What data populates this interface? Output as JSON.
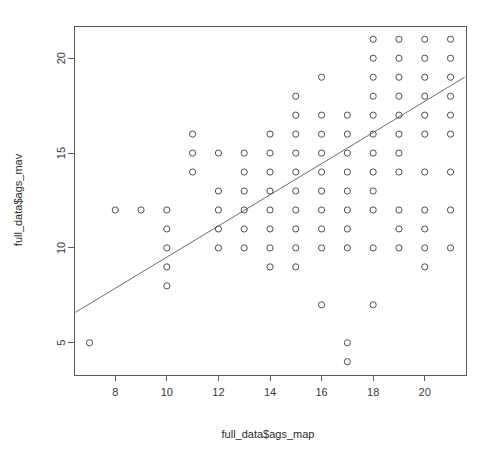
{
  "chart_data": {
    "type": "scatter",
    "title": "",
    "xlabel": "full_data$ags_map",
    "ylabel": "full_data$ags_mav",
    "xlim": [
      6.4,
      21.6
    ],
    "ylim": [
      3.3,
      21.7
    ],
    "xticks": [
      8,
      10,
      12,
      14,
      16,
      18,
      20
    ],
    "yticks": [
      5,
      10,
      15,
      20
    ],
    "xtick_labels": [
      "8",
      "10",
      "12",
      "14",
      "16",
      "18",
      "20"
    ],
    "ytick_labels": [
      "5",
      "10",
      "15",
      "20"
    ],
    "grid": false,
    "legend": "none",
    "marker": "open-circle",
    "marker_color": "#4f4f4f",
    "points": [
      [
        7,
        5
      ],
      [
        8,
        12
      ],
      [
        9,
        12
      ],
      [
        10,
        12
      ],
      [
        10,
        11
      ],
      [
        10,
        10
      ],
      [
        10,
        9
      ],
      [
        10,
        8
      ],
      [
        11,
        16
      ],
      [
        11,
        15
      ],
      [
        11,
        14
      ],
      [
        12,
        15
      ],
      [
        12,
        13
      ],
      [
        12,
        12
      ],
      [
        12,
        11
      ],
      [
        12,
        10
      ],
      [
        13,
        15
      ],
      [
        13,
        14
      ],
      [
        13,
        13
      ],
      [
        13,
        12
      ],
      [
        13,
        11
      ],
      [
        13,
        10
      ],
      [
        14,
        16
      ],
      [
        14,
        15
      ],
      [
        14,
        14
      ],
      [
        14,
        13
      ],
      [
        14,
        12
      ],
      [
        14,
        11
      ],
      [
        14,
        10
      ],
      [
        14,
        9
      ],
      [
        15,
        18
      ],
      [
        15,
        17
      ],
      [
        15,
        16
      ],
      [
        15,
        15
      ],
      [
        15,
        14
      ],
      [
        15,
        13
      ],
      [
        15,
        12
      ],
      [
        15,
        11
      ],
      [
        15,
        10
      ],
      [
        15,
        9
      ],
      [
        16,
        19
      ],
      [
        16,
        17
      ],
      [
        16,
        16
      ],
      [
        16,
        15
      ],
      [
        16,
        14
      ],
      [
        16,
        13
      ],
      [
        16,
        12
      ],
      [
        16,
        11
      ],
      [
        16,
        10
      ],
      [
        16,
        7
      ],
      [
        17,
        17
      ],
      [
        17,
        16
      ],
      [
        17,
        15
      ],
      [
        17,
        14
      ],
      [
        17,
        13
      ],
      [
        17,
        12
      ],
      [
        17,
        11
      ],
      [
        17,
        10
      ],
      [
        17,
        5
      ],
      [
        17,
        4
      ],
      [
        18,
        21
      ],
      [
        18,
        20
      ],
      [
        18,
        19
      ],
      [
        18,
        18
      ],
      [
        18,
        17
      ],
      [
        18,
        16
      ],
      [
        18,
        15
      ],
      [
        18,
        14
      ],
      [
        18,
        13
      ],
      [
        18,
        12
      ],
      [
        18,
        10
      ],
      [
        18,
        7
      ],
      [
        19,
        21
      ],
      [
        19,
        20
      ],
      [
        19,
        19
      ],
      [
        19,
        18
      ],
      [
        19,
        17
      ],
      [
        19,
        16
      ],
      [
        19,
        15
      ],
      [
        19,
        14
      ],
      [
        19,
        12
      ],
      [
        19,
        11
      ],
      [
        19,
        10
      ],
      [
        20,
        21
      ],
      [
        20,
        20
      ],
      [
        20,
        19
      ],
      [
        20,
        18
      ],
      [
        20,
        17
      ],
      [
        20,
        16
      ],
      [
        20,
        14
      ],
      [
        20,
        12
      ],
      [
        20,
        11
      ],
      [
        20,
        10
      ],
      [
        20,
        9
      ],
      [
        21,
        21
      ],
      [
        21,
        20
      ],
      [
        21,
        19
      ],
      [
        21,
        18
      ],
      [
        21,
        17
      ],
      [
        21,
        16
      ],
      [
        21,
        14
      ],
      [
        21,
        12
      ],
      [
        21,
        10
      ]
    ],
    "fit_line": {
      "type": "linear",
      "x_start": 6.45,
      "y_start": 6.6,
      "x_end": 21.55,
      "y_end": 19.0,
      "color": "#6b6b6b"
    }
  }
}
